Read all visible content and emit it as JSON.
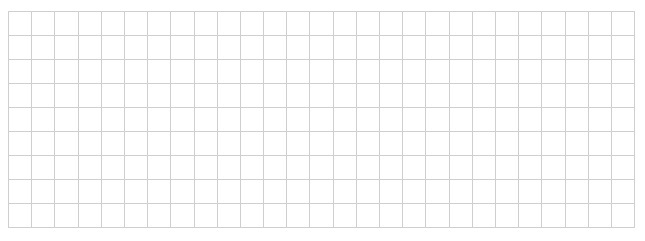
{
  "grid": {
    "columns": 27,
    "rows": 9,
    "cell_width": 23.2,
    "cell_height": 24,
    "line_color": "#cfcfcf",
    "background": "#ffffff",
    "cells_content": "empty"
  }
}
